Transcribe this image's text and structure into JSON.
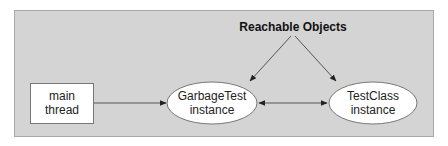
{
  "diagram": {
    "title": "Reachable Objects",
    "nodes": [
      {
        "id": "main-thread",
        "shape": "rectangle",
        "line1": "main",
        "line2": "thread"
      },
      {
        "id": "garbagetest-instance",
        "shape": "ellipse",
        "line1": "GarbageTest",
        "line2": "instance"
      },
      {
        "id": "testclass-instance",
        "shape": "ellipse",
        "line1": "TestClass",
        "line2": "instance"
      }
    ],
    "edges": [
      {
        "from": "main-thread",
        "to": "garbagetest-instance",
        "direction": "forward"
      },
      {
        "from": "garbagetest-instance",
        "to": "testclass-instance",
        "direction": "both"
      },
      {
        "from": "Reachable Objects",
        "to": "garbagetest-instance",
        "direction": "forward"
      },
      {
        "from": "Reachable Objects",
        "to": "testclass-instance",
        "direction": "forward"
      }
    ],
    "colors": {
      "panel": "#d4d4d4",
      "panel_border": "#a8a8a8",
      "node_fill": "#ffffff",
      "stroke": "#555555"
    }
  }
}
